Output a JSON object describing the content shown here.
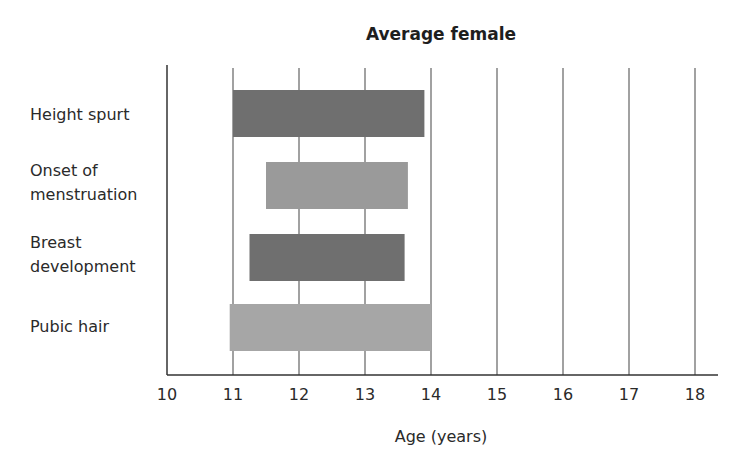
{
  "chart_data": {
    "type": "bar",
    "orientation": "horizontal-range",
    "title": "Average female",
    "xlabel": "Age (years)",
    "ylabel": "",
    "xlim": [
      10,
      18
    ],
    "x_ticks": [
      10,
      11,
      12,
      13,
      14,
      15,
      16,
      17,
      18
    ],
    "grid": true,
    "legend": null,
    "categories": [
      [
        "Height spurt"
      ],
      [
        "Onset of",
        "menstruation"
      ],
      [
        "Breast",
        "development"
      ],
      [
        "Pubic hair"
      ]
    ],
    "series": [
      {
        "name": "Height spurt",
        "start": 11.0,
        "end": 13.9,
        "color": "#6f6f6f"
      },
      {
        "name": "Onset of menstruation",
        "start": 11.5,
        "end": 13.65,
        "color": "#9a9a9a"
      },
      {
        "name": "Breast development",
        "start": 11.25,
        "end": 13.6,
        "color": "#6f6f6f"
      },
      {
        "name": "Pubic hair",
        "start": 10.95,
        "end": 14.0,
        "color": "#a6a6a6"
      }
    ]
  }
}
